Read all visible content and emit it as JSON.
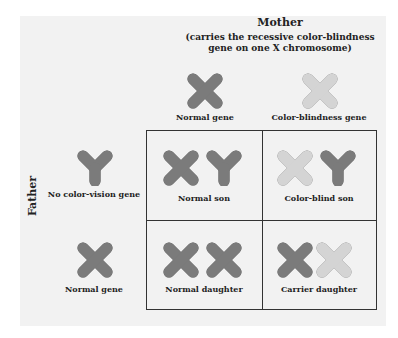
{
  "colors": {
    "normal_fill": "#7b7b7b",
    "normal_stroke": "#4e4e4e",
    "colorblind_fill": "#d4d4d4",
    "colorblind_stroke": "#6a6a6a",
    "panel_bg": "#f2f2f2",
    "grid_line": "#333333"
  },
  "mother": {
    "title": "Mother",
    "subtitle_line1": "(carries the recessive color-blindness",
    "subtitle_line2": "gene on one X chromosome)",
    "gametes": [
      {
        "chromosome": "X",
        "type": "normal",
        "label": "Normal gene"
      },
      {
        "chromosome": "X",
        "type": "colorblind",
        "label": "Color-blindness gene"
      }
    ]
  },
  "father": {
    "title": "Father",
    "gametes": [
      {
        "chromosome": "Y",
        "type": "normal",
        "label": "No color-vision gene"
      },
      {
        "chromosome": "X",
        "type": "normal",
        "label": "Normal gene"
      }
    ]
  },
  "punnett": {
    "cells": [
      {
        "row": 0,
        "col": 0,
        "chromosomes": [
          "X-normal",
          "Y"
        ],
        "label": "Normal son"
      },
      {
        "row": 0,
        "col": 1,
        "chromosomes": [
          "X-colorblind",
          "Y"
        ],
        "label": "Color-blind son"
      },
      {
        "row": 1,
        "col": 0,
        "chromosomes": [
          "X-normal",
          "X-normal"
        ],
        "label": "Normal daughter"
      },
      {
        "row": 1,
        "col": 1,
        "chromosomes": [
          "X-normal",
          "X-colorblind"
        ],
        "label": "Carrier daughter"
      }
    ]
  }
}
